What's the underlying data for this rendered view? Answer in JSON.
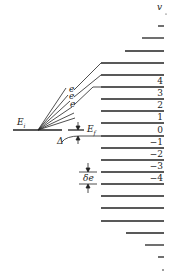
{
  "diagram": {
    "axis_label": "v",
    "initial_level_label": "E",
    "initial_level_sub": "i",
    "final_level_label": "E",
    "final_level_sub": "f",
    "delta_label": "Δ",
    "spacing_label": "δe",
    "fan_labels": [
      "e",
      "e",
      "e"
    ],
    "level_numbers": [
      "4",
      "3",
      "2",
      "1",
      "0",
      "−1",
      "−2",
      "−3",
      "−4"
    ],
    "colors": {
      "line": "#222222",
      "background": "#ffffff"
    }
  }
}
